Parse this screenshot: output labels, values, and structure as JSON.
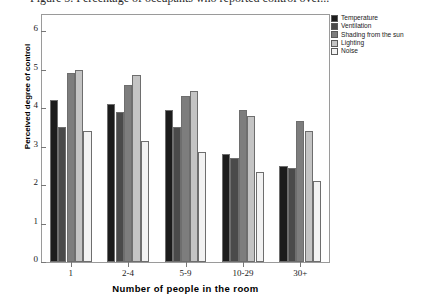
{
  "figure": {
    "caption": "Figure 5. Percentage of occupants who reported control over..."
  },
  "chart_data": {
    "type": "bar",
    "title": "",
    "xlabel": "Number of people in the room",
    "ylabel": "Perceived degree of control",
    "categories": [
      "1",
      "2-4",
      "5-9",
      "10-29",
      "30+"
    ],
    "ylim": [
      0,
      6
    ],
    "yticks": [
      0,
      1,
      2,
      3,
      4,
      5,
      6
    ],
    "grid": false,
    "legend_position": "top-right",
    "series": [
      {
        "name": "Temperature",
        "color": "#1c1c1c",
        "values": [
          4.2,
          4.1,
          3.95,
          2.8,
          2.5
        ]
      },
      {
        "name": "Ventilation",
        "color": "#4a4a4a",
        "values": [
          3.5,
          3.9,
          3.5,
          2.7,
          2.45
        ]
      },
      {
        "name": "Shading from the sun",
        "color": "#7d7d7d",
        "values": [
          4.9,
          4.6,
          4.3,
          3.95,
          3.65
        ]
      },
      {
        "name": "Lighting",
        "color": "#c4c4c4",
        "values": [
          5.0,
          4.85,
          4.45,
          3.8,
          3.4
        ]
      },
      {
        "name": "Noise",
        "color": "#f2f2f2",
        "values": [
          3.4,
          3.15,
          2.85,
          2.35,
          2.1
        ]
      }
    ]
  }
}
